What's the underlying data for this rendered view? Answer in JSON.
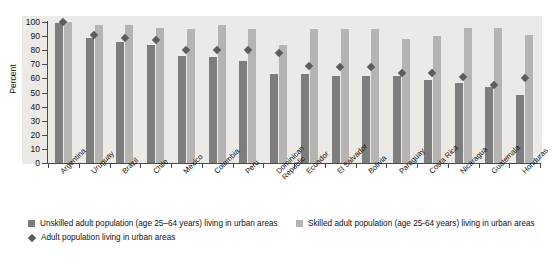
{
  "chart_data": {
    "type": "bar",
    "title": "",
    "xlabel": "",
    "ylabel": "Percent",
    "ylim": [
      0,
      100
    ],
    "yticks": [
      0,
      10,
      20,
      30,
      40,
      50,
      60,
      70,
      80,
      90,
      100
    ],
    "grid": false,
    "legend_position": "bottom",
    "categories": [
      "Argentina",
      "Uruguay",
      "Brazil",
      "Chile",
      "Mexico",
      "Colombia",
      "Peru",
      "Dominican\nRepublic",
      "Ecuador",
      "El Salvador",
      "Bolivia",
      "Paraguay",
      "Costa Rica",
      "Nicaragua",
      "Guatemala",
      "Honduras"
    ],
    "series": [
      {
        "name": "Unskilled adult population (age 25–64 years) living in urban areas",
        "color": "#7d7d7d",
        "type": "bar",
        "values": [
          99,
          89,
          86,
          84,
          76,
          75,
          72,
          63,
          63,
          62,
          62,
          62,
          59,
          57,
          54,
          48
        ]
      },
      {
        "name": "Skilled adult population (age 25-64 years) living in urban areas",
        "color": "#b6b4b2",
        "type": "bar",
        "values": [
          100,
          98,
          98,
          96,
          95,
          98,
          95,
          84,
          95,
          95,
          95,
          88,
          90,
          96,
          96,
          91
        ]
      },
      {
        "name": "Adult population living in urban areas",
        "color": "#5c5c5c",
        "type": "marker",
        "marker": "diamond",
        "values": [
          100,
          91,
          89,
          87,
          80,
          80,
          80,
          78,
          69,
          68,
          68,
          64,
          64,
          61,
          55,
          60
        ]
      }
    ]
  },
  "legend": {
    "items": [
      {
        "key": "unskilled-swatch",
        "label": "Unskilled adult population (age 25–64 years) living in urban areas"
      },
      {
        "key": "diamond-swatch",
        "label": "Adult population living in urban areas"
      },
      {
        "key": "skilled-swatch",
        "label": "Skilled adult population (age 25-64 years) living in urban areas"
      }
    ]
  }
}
